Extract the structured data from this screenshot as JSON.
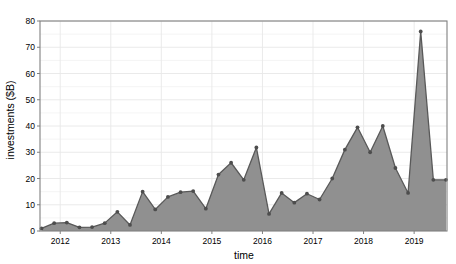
{
  "chart_data": {
    "type": "area",
    "title": "",
    "subtitle": "",
    "xlabel": "time",
    "ylabel": "investments ($B)",
    "xlim": [
      2011.6,
      2019.65
    ],
    "ylim": [
      0,
      80
    ],
    "grid": true,
    "legend": null,
    "x_ticks": [
      2012,
      2013,
      2014,
      2015,
      2016,
      2017,
      2018,
      2019
    ],
    "x_tick_labels": [
      "2012",
      "2013",
      "2014",
      "2015",
      "2016",
      "2017",
      "2018",
      "2019"
    ],
    "y_ticks": [
      0,
      10,
      20,
      30,
      40,
      50,
      60,
      70,
      80
    ],
    "y_tick_labels": [
      "0",
      "10",
      "20",
      "30",
      "40",
      "50",
      "60",
      "70",
      "80"
    ],
    "series_name": "investments",
    "line_color": "#595959",
    "fill_color": "#909090",
    "marker_color": "#4d4d4d",
    "grid_color": "#e8e8e8",
    "axis_color": "#808080",
    "x": [
      2011.63,
      2011.88,
      2012.13,
      2012.38,
      2012.63,
      2012.88,
      2013.13,
      2013.38,
      2013.63,
      2013.88,
      2014.13,
      2014.38,
      2014.63,
      2014.88,
      2015.13,
      2015.38,
      2015.63,
      2015.88,
      2016.13,
      2016.38,
      2016.63,
      2016.88,
      2017.13,
      2017.38,
      2017.63,
      2017.88,
      2018.13,
      2018.38,
      2018.63,
      2018.88,
      2019.13,
      2019.38,
      2019.63
    ],
    "y": [
      1.0,
      3.0,
      3.2,
      1.4,
      1.5,
      3.0,
      7.3,
      2.3,
      15.0,
      8.2,
      13.0,
      14.8,
      15.2,
      8.5,
      21.5,
      26.0,
      19.5,
      31.8,
      6.5,
      14.5,
      10.8,
      14.2,
      12.0,
      20.0,
      31.0,
      39.5,
      30.0,
      40.0,
      24.0,
      14.5,
      76.0,
      19.5,
      19.5
    ],
    "points": [
      {
        "x": 2011.63,
        "y": 1.0
      },
      {
        "x": 2011.88,
        "y": 3.0
      },
      {
        "x": 2012.13,
        "y": 3.2
      },
      {
        "x": 2012.38,
        "y": 1.4
      },
      {
        "x": 2012.63,
        "y": 1.5
      },
      {
        "x": 2012.88,
        "y": 3.0
      },
      {
        "x": 2013.13,
        "y": 7.3
      },
      {
        "x": 2013.38,
        "y": 2.3
      },
      {
        "x": 2013.63,
        "y": 15.0
      },
      {
        "x": 2013.88,
        "y": 8.2
      },
      {
        "x": 2014.13,
        "y": 13.0
      },
      {
        "x": 2014.38,
        "y": 14.8
      },
      {
        "x": 2014.63,
        "y": 15.2
      },
      {
        "x": 2014.88,
        "y": 8.5
      },
      {
        "x": 2015.13,
        "y": 21.5
      },
      {
        "x": 2015.38,
        "y": 26.0
      },
      {
        "x": 2015.63,
        "y": 19.5
      },
      {
        "x": 2015.88,
        "y": 31.8
      },
      {
        "x": 2016.13,
        "y": 6.5
      },
      {
        "x": 2016.38,
        "y": 14.5
      },
      {
        "x": 2016.63,
        "y": 10.8
      },
      {
        "x": 2016.88,
        "y": 14.2
      },
      {
        "x": 2017.13,
        "y": 12.0
      },
      {
        "x": 2017.38,
        "y": 20.0
      },
      {
        "x": 2017.63,
        "y": 31.0
      },
      {
        "x": 2017.88,
        "y": 39.5
      },
      {
        "x": 2018.13,
        "y": 30.0
      },
      {
        "x": 2018.38,
        "y": 40.0
      },
      {
        "x": 2018.63,
        "y": 24.0
      },
      {
        "x": 2018.88,
        "y": 14.5
      },
      {
        "x": 2019.13,
        "y": 76.0
      },
      {
        "x": 2019.38,
        "y": 19.5
      },
      {
        "x": 2019.63,
        "y": 19.5
      }
    ]
  }
}
